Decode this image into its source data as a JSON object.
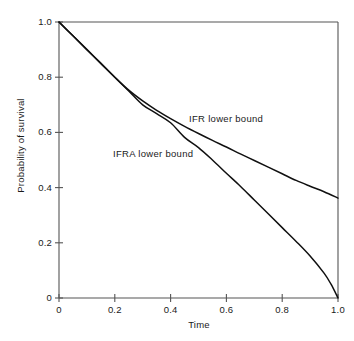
{
  "chart_data": {
    "type": "line",
    "title": "",
    "xlabel": "Time",
    "ylabel": "Probability of survival",
    "xlim": [
      0,
      1.0
    ],
    "ylim": [
      0,
      1.0
    ],
    "grid": false,
    "legend_position": "inline-annotations",
    "xticks": [
      "0",
      "0.2",
      "0.4",
      "0.6",
      "0.8",
      "1.0"
    ],
    "xtick_values": [
      0,
      0.2,
      0.4,
      0.6,
      0.8,
      1.0
    ],
    "yticks": [
      "0",
      "0.2",
      "0.4",
      "0.6",
      "0.8",
      "1.0"
    ],
    "ytick_values": [
      0,
      0.2,
      0.4,
      0.6,
      0.8,
      1.0
    ],
    "annotations": [
      {
        "text": "IFR lower bound",
        "x": 0.47,
        "y": 0.67
      },
      {
        "text": "IFRA lower bound",
        "x": 0.19,
        "y": 0.545
      }
    ],
    "series": [
      {
        "name": "IFR lower bound",
        "x": [
          0.0,
          0.05,
          0.1,
          0.15,
          0.2,
          0.25,
          0.3,
          0.35,
          0.4,
          0.45,
          0.5,
          0.55,
          0.6,
          0.65,
          0.7,
          0.75,
          0.8,
          0.85,
          0.9,
          0.95,
          1.0
        ],
        "values": [
          1.0,
          0.95,
          0.9,
          0.85,
          0.8,
          0.753,
          0.714,
          0.68,
          0.65,
          0.622,
          0.596,
          0.571,
          0.547,
          0.522,
          0.498,
          0.474,
          0.45,
          0.426,
          0.405,
          0.385,
          0.362
        ]
      },
      {
        "name": "IFRA lower bound",
        "x": [
          0.0,
          0.05,
          0.1,
          0.15,
          0.2,
          0.25,
          0.3,
          0.35,
          0.4,
          0.45,
          0.5,
          0.55,
          0.6,
          0.65,
          0.7,
          0.75,
          0.8,
          0.85,
          0.9,
          0.95,
          0.975,
          1.0
        ],
        "values": [
          1.0,
          0.95,
          0.9,
          0.85,
          0.8,
          0.75,
          0.7,
          0.668,
          0.635,
          0.582,
          0.545,
          0.5,
          0.452,
          0.405,
          0.355,
          0.305,
          0.255,
          0.205,
          0.152,
          0.09,
          0.05,
          0.0
        ]
      }
    ],
    "series_color": "#101010",
    "axis_color": "#555555",
    "background": "#ffffff"
  }
}
